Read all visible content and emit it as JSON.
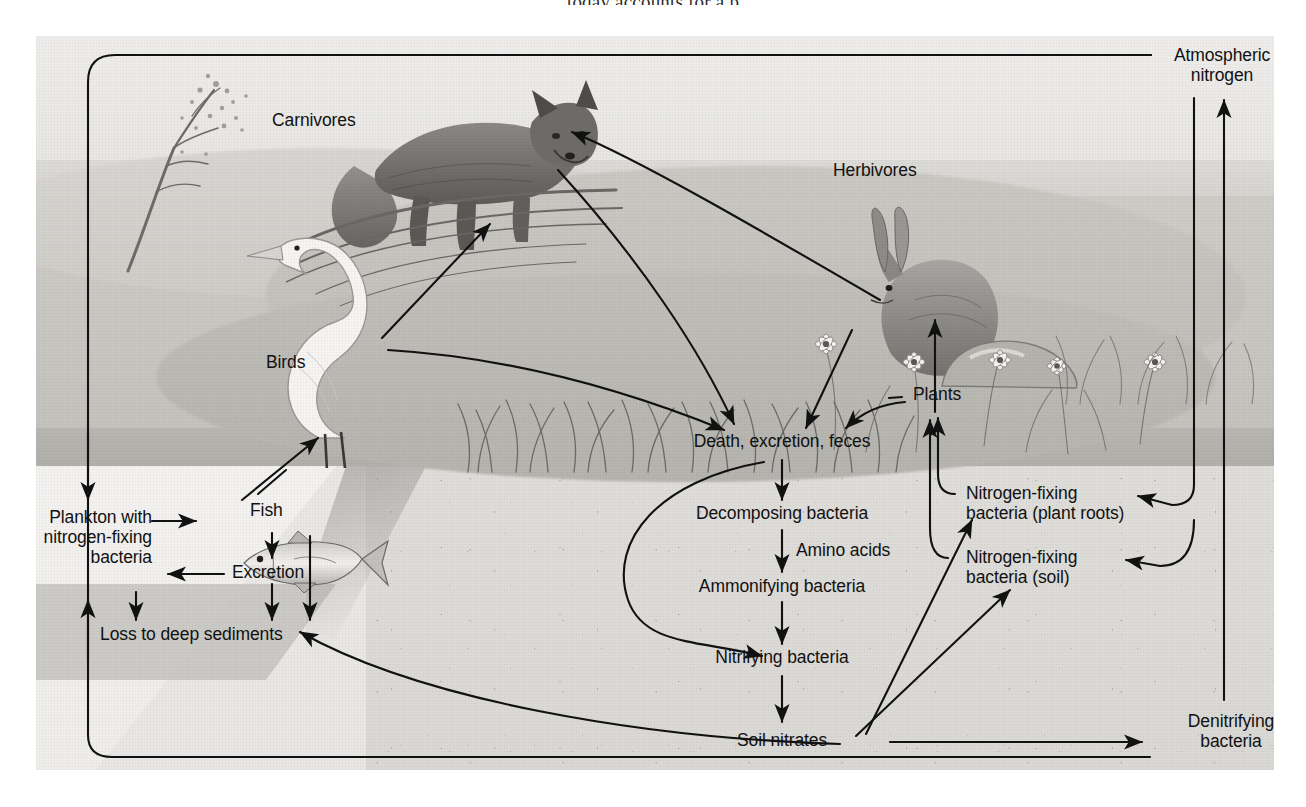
{
  "page": {
    "running_text_fragment": "today accounts for a p"
  },
  "figure": {
    "type": "diagram",
    "labels": {
      "atmospheric_nitrogen": "Atmospheric\nnitrogen",
      "carnivores": "Carnivores",
      "herbivores": "Herbivores",
      "birds": "Birds",
      "fish": "Fish",
      "plants": "Plants",
      "plankton": "Plankton with\nnitrogen-fixing\nbacteria",
      "excretion": "Excretion",
      "loss_sediments": "Loss to deep sediments",
      "death_excretion_feces": "Death, excretion, feces",
      "decomposing_bacteria": "Decomposing bacteria",
      "amino_acids": "Amino acids",
      "ammonifying_bacteria": "Ammonifying bacteria",
      "nitrifying_bacteria": "Nitrifying bacteria",
      "soil_nitrates": "Soil nitrates",
      "nfix_roots": "Nitrogen-fixing\nbacteria (plant roots)",
      "nfix_soil": "Nitrogen-fixing\nbacteria (soil)",
      "denitrifying_bacteria": "Denitrifying\nbacteria"
    },
    "organisms": [
      {
        "name": "fox",
        "role": "carnivore"
      },
      {
        "name": "egret",
        "role": "bird"
      },
      {
        "name": "rabbit",
        "role": "herbivore"
      },
      {
        "name": "trout",
        "role": "fish"
      },
      {
        "name": "shrub",
        "role": "vegetation"
      },
      {
        "name": "daisies",
        "role": "vegetation"
      }
    ],
    "flows": [
      {
        "from": "Atmospheric nitrogen",
        "to": "Nitrogen-fixing bacteria (plant roots)"
      },
      {
        "from": "Atmospheric nitrogen",
        "to": "Nitrogen-fixing bacteria (soil)"
      },
      {
        "from": "Denitrifying bacteria",
        "to": "Atmospheric nitrogen"
      },
      {
        "from": "Soil nitrates",
        "to": "Denitrifying bacteria"
      },
      {
        "from": "Soil nitrates",
        "to": "Nitrogen-fixing bacteria (plant roots)"
      },
      {
        "from": "Soil nitrates",
        "to": "Nitrogen-fixing bacteria (soil)"
      },
      {
        "from": "Soil nitrates",
        "to": "Plants"
      },
      {
        "from": "Soil nitrates",
        "to": "Loss to deep sediments"
      },
      {
        "from": "Soil nitrates",
        "to": "Plankton with nitrogen-fixing bacteria"
      },
      {
        "from": "Plants",
        "to": "Herbivores"
      },
      {
        "from": "Plants",
        "to": "Death, excretion, feces"
      },
      {
        "from": "Herbivores",
        "to": "Carnivores"
      },
      {
        "from": "Herbivores",
        "to": "Death, excretion, feces"
      },
      {
        "from": "Carnivores",
        "to": "Death, excretion, feces"
      },
      {
        "from": "Birds",
        "to": "Carnivores"
      },
      {
        "from": "Birds",
        "to": "Death, excretion, feces"
      },
      {
        "from": "Fish",
        "to": "Birds"
      },
      {
        "from": "Fish",
        "to": "Excretion"
      },
      {
        "from": "Fish",
        "to": "Loss to deep sediments"
      },
      {
        "from": "Plankton with nitrogen-fixing bacteria",
        "to": "Fish"
      },
      {
        "from": "Excretion",
        "to": "Plankton with nitrogen-fixing bacteria"
      },
      {
        "from": "Excretion",
        "to": "Loss to deep sediments"
      },
      {
        "from": "Plankton with nitrogen-fixing bacteria",
        "to": "Loss to deep sediments"
      },
      {
        "from": "Death, excretion, feces",
        "to": "Decomposing bacteria"
      },
      {
        "from": "Death, excretion, feces",
        "to": "Nitrifying bacteria"
      },
      {
        "from": "Decomposing bacteria",
        "to": "Ammonifying bacteria",
        "via": "Amino acids"
      },
      {
        "from": "Ammonifying bacteria",
        "to": "Nitrifying bacteria"
      },
      {
        "from": "Nitrifying bacteria",
        "to": "Soil nitrates"
      },
      {
        "from": "Nitrogen-fixing bacteria (plant roots)",
        "to": "Plants"
      },
      {
        "from": "Nitrogen-fixing bacteria (soil)",
        "to": "Plants"
      }
    ],
    "colors": {
      "ink": "#111111",
      "plate_background": "#e9e8e6",
      "water": "#f3f2f0",
      "deep_sediment": "#c6c4c0",
      "field": "#c7c5c0"
    }
  }
}
